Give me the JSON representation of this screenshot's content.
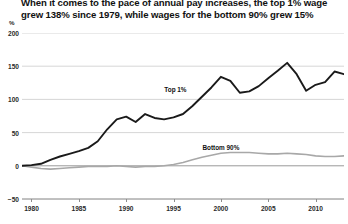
{
  "title": {
    "line1": "When it comes to the pace of annual pay increases, the top 1% wage",
    "line2": "grew 138% since 1979, while wages for the bottom 90% grew 15%"
  },
  "unit_label": "%",
  "chart_data": {
    "type": "line",
    "title": "When it comes to the pace of annual pay increases, the top 1% wage grew 138% since 1979, while wages for the bottom 90% grew 15%",
    "xlabel": "",
    "ylabel": "%",
    "xlim": [
      1979,
      2013
    ],
    "ylim": [
      -50,
      200
    ],
    "yticks": [
      200,
      150,
      100,
      50,
      0,
      -50
    ],
    "xticks": [
      1980,
      1985,
      1990,
      1995,
      2000,
      2005,
      2010
    ],
    "grid": true,
    "legend_position": "inline-annotation",
    "colors": {
      "top_1_percent": "#1a1a1a",
      "bottom_90_percent": "#a8a8a8",
      "gridline": "#cccccc",
      "axis": "#8d8d8d"
    },
    "annotations": [
      {
        "text": "Top 1%",
        "x": 1995.2,
        "y": 115
      },
      {
        "text": "Bottom 90%",
        "x": 2000.0,
        "y": 28
      },
      {
        "text": "138%",
        "x": 2013.6,
        "y": 138
      },
      {
        "text": "15%",
        "x": 2013.6,
        "y": 15
      }
    ],
    "series": [
      {
        "name": "Top 1%",
        "color": "#1a1a1a",
        "x": [
          1979,
          1980,
          1981,
          1982,
          1983,
          1984,
          1985,
          1986,
          1987,
          1988,
          1989,
          1990,
          1991,
          1992,
          1993,
          1994,
          1995,
          1996,
          1997,
          1998,
          1999,
          2000,
          2001,
          2002,
          2003,
          2004,
          2005,
          2006,
          2007,
          2008,
          2009,
          2010,
          2011,
          2012,
          2013
        ],
        "values": [
          0,
          1,
          3,
          9,
          14,
          18,
          22,
          27,
          37,
          55,
          70,
          74,
          66,
          78,
          72,
          70,
          73,
          78,
          90,
          104,
          118,
          134,
          128,
          110,
          112,
          120,
          132,
          143,
          155,
          138,
          113,
          122,
          126,
          142,
          138
        ]
      },
      {
        "name": "Bottom 90%",
        "color": "#a8a8a8",
        "x": [
          1979,
          1980,
          1981,
          1982,
          1983,
          1984,
          1985,
          1986,
          1987,
          1988,
          1989,
          1990,
          1991,
          1992,
          1993,
          1994,
          1995,
          1996,
          1997,
          1998,
          1999,
          2000,
          2001,
          2002,
          2003,
          2004,
          2005,
          2006,
          2007,
          2008,
          2009,
          2010,
          2011,
          2012,
          2013
        ],
        "values": [
          0,
          -2,
          -4,
          -5,
          -4,
          -3,
          -2,
          -1,
          -1,
          -1,
          0,
          -1,
          -2,
          -1,
          -1,
          0,
          2,
          5,
          9,
          13,
          16,
          19,
          20,
          20,
          20,
          19,
          18,
          18,
          19,
          18,
          17,
          15,
          14,
          14,
          15
        ]
      }
    ]
  }
}
